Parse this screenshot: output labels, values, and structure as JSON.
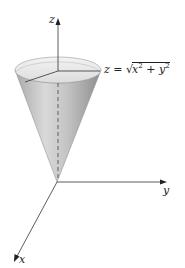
{
  "diagram": {
    "axes": {
      "z": {
        "label": "z"
      },
      "y": {
        "label": "y"
      },
      "x": {
        "label": "x"
      }
    },
    "surface_equation": {
      "lhs": "z",
      "equals": "=",
      "radical_symbol": "√",
      "term1_base": "x",
      "term1_exp": "2",
      "plus": "+",
      "term2_base": "y",
      "term2_exp": "2"
    },
    "colors": {
      "axis": "#333333",
      "cone_light": "#e6e6e6",
      "cone_dark": "#8a8a8a"
    }
  }
}
